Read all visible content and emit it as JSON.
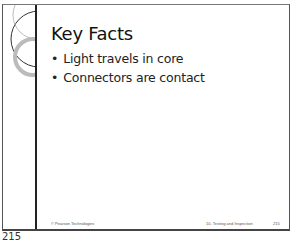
{
  "slide": {
    "title": "Key Facts",
    "bullets": [
      {
        "marker": "•",
        "text": "Light travels in core"
      },
      {
        "marker": "•",
        "text": "Connectors are contact"
      }
    ],
    "footer": {
      "left": "© Pearson Technologies",
      "middle": "10- Testing and Inspection",
      "right": "215"
    }
  },
  "page_number": "215",
  "colors": {
    "frame": "#555555",
    "accent_line": "#222222",
    "decor_ring": "#bbbbbb"
  }
}
